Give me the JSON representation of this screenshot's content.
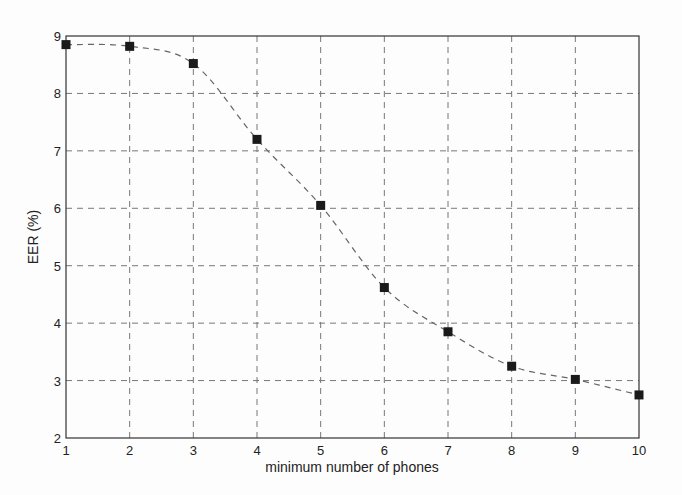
{
  "chart_data": {
    "type": "line",
    "title": "",
    "xlabel": "minimum number of phones",
    "ylabel": "EER (%)",
    "x": [
      1,
      2,
      3,
      4,
      5,
      6,
      7,
      8,
      9,
      10
    ],
    "series": [
      {
        "name": "EER",
        "values": [
          8.85,
          8.82,
          8.52,
          7.2,
          6.05,
          4.62,
          3.85,
          3.25,
          3.02,
          2.75
        ],
        "marker": "square",
        "line_style": "dashed"
      }
    ],
    "xlim": [
      1,
      10
    ],
    "ylim": [
      2,
      9
    ],
    "xticks": [
      "1",
      "2",
      "3",
      "4",
      "5",
      "6",
      "7",
      "8",
      "9",
      "10"
    ],
    "yticks": [
      "2",
      "3",
      "4",
      "5",
      "6",
      "7",
      "8",
      "9"
    ],
    "grid": true,
    "legend": null
  },
  "labels": {
    "xlabel": "minimum number of phones",
    "ylabel": "EER (%)"
  }
}
